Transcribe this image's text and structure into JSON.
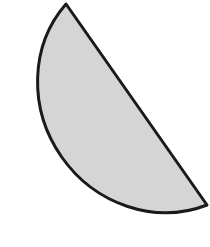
{
  "figure": {
    "shape": "semicircle",
    "fill_color": "#d5d5d5",
    "stroke_color": "#1a1a1a",
    "stroke_width": 3,
    "vertices": {
      "chord_start": [
        66,
        4
      ],
      "chord_end": [
        207,
        205
      ]
    },
    "arc": {
      "rx": 126,
      "ry": 118,
      "rotation": 55
    }
  }
}
